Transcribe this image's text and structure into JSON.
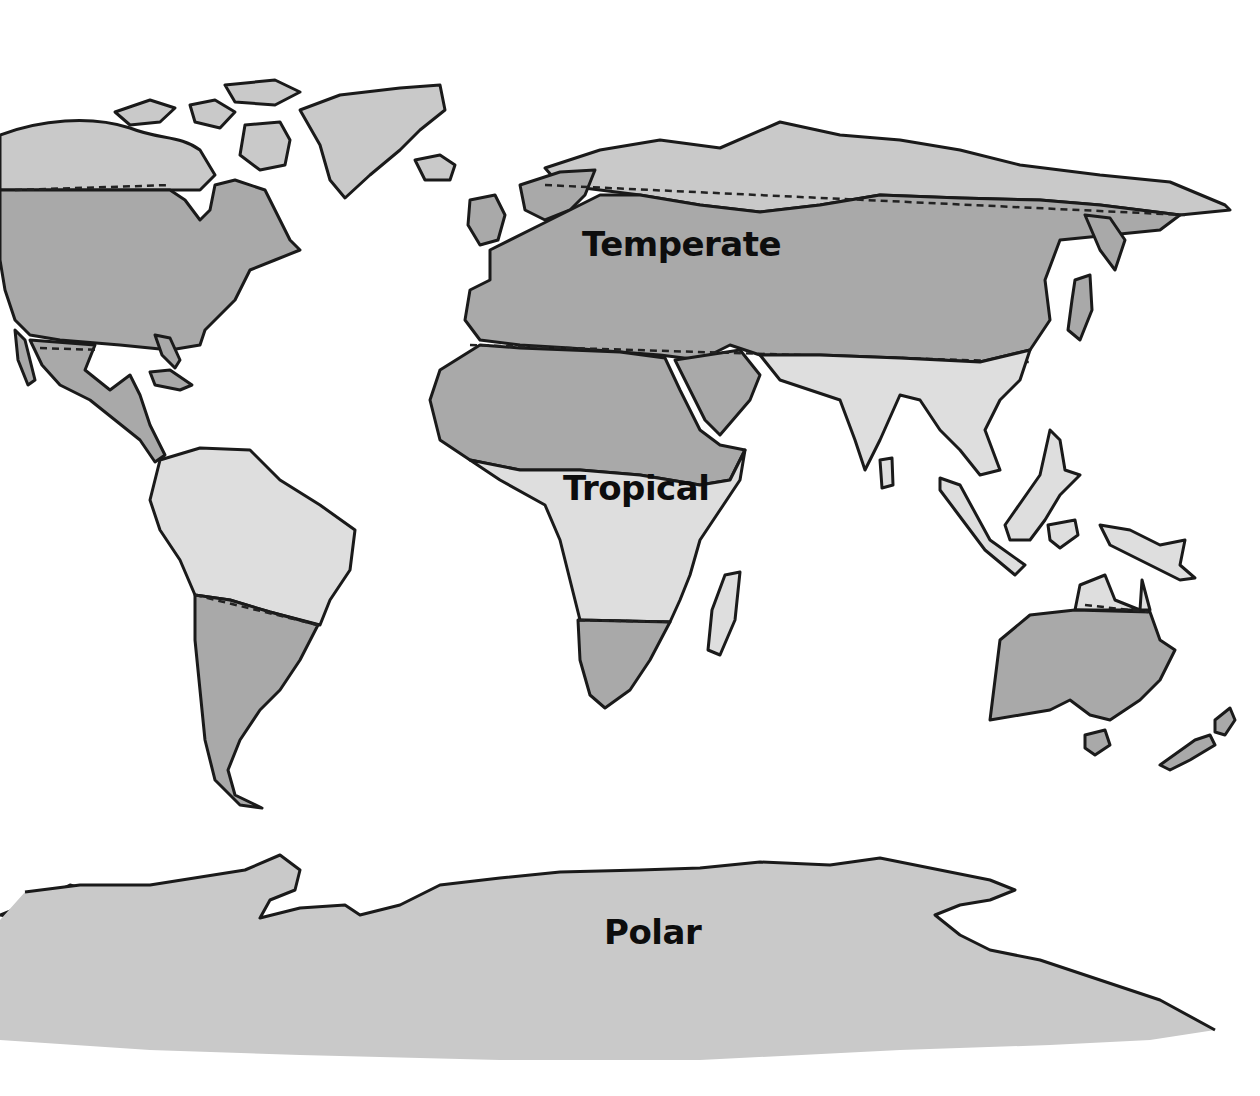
{
  "map": {
    "title": "Climate Zones of the World",
    "style": "grayscale watercolor",
    "zones": [
      {
        "id": "temperate",
        "label": "Temperate",
        "color": "#a9a9a9"
      },
      {
        "id": "tropical",
        "label": "Tropical",
        "color": "#dedede"
      },
      {
        "id": "polar",
        "label": "Polar",
        "color": "#c9c9c9"
      }
    ],
    "continents": [
      "North America",
      "Greenland",
      "South America",
      "Europe",
      "Africa",
      "Asia",
      "Australia",
      "New Zealand",
      "Antarctica"
    ],
    "zone_boundaries": "dashed lines"
  }
}
